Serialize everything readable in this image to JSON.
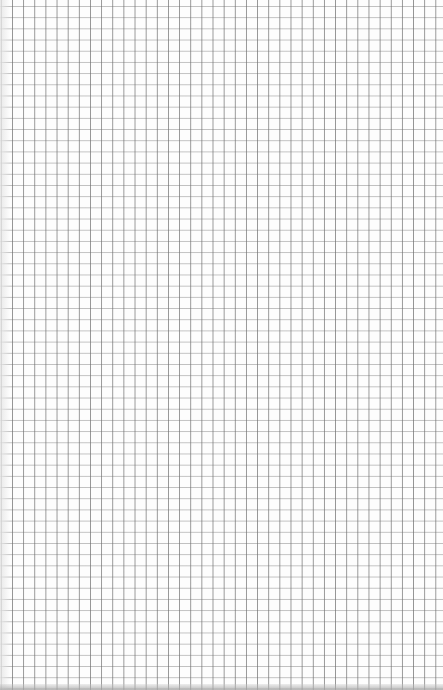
{
  "document": {
    "type": "graph-paper",
    "grid": {
      "cell_width_px": 11.15,
      "cell_height_px": 11.2,
      "line_color": "#8a8a8a",
      "background_color": "#fdfdfd"
    }
  }
}
